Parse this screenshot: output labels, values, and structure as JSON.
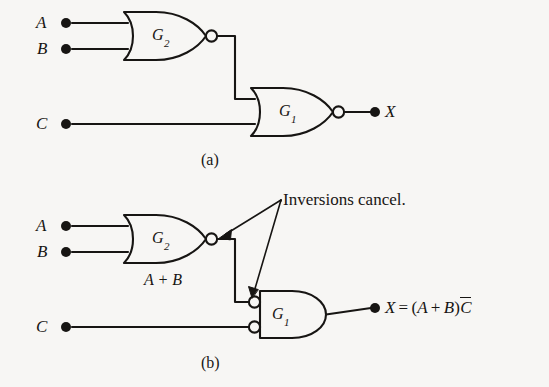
{
  "figure": {
    "background_color": "#f7f6f4",
    "ink_color": "#171513",
    "width": 549,
    "height": 387
  },
  "circuit_a": {
    "caption": "(a)",
    "inputs": [
      {
        "label": "A",
        "node": "input-a"
      },
      {
        "label": "B",
        "node": "input-b"
      },
      {
        "label": "C",
        "node": "input-c"
      }
    ],
    "gates": [
      {
        "name": "G",
        "subscript": "2",
        "type": "NOR",
        "inverted_output": true
      },
      {
        "name": "G",
        "subscript": "1",
        "type": "NOR",
        "inverted_output": true
      }
    ],
    "output": {
      "label": "X"
    }
  },
  "circuit_b": {
    "caption": "(b)",
    "inputs": [
      {
        "label": "A",
        "node": "input-a"
      },
      {
        "label": "B",
        "node": "input-b"
      },
      {
        "label": "C",
        "node": "input-c"
      }
    ],
    "gates": [
      {
        "name": "G",
        "subscript": "2",
        "type": "NOR",
        "inverted_output": true
      },
      {
        "name": "G",
        "subscript": "1",
        "type": "AND",
        "inverted_inputs": true
      }
    ],
    "wire_label": "A  +  B",
    "annotation": "Inversions cancel.",
    "output": {
      "label": "X",
      "equals": "=",
      "open_paren": "(",
      "term_a": "A",
      "plus": "+",
      "term_b": "B",
      "close_paren": ")",
      "term_c_bar": "C"
    }
  }
}
